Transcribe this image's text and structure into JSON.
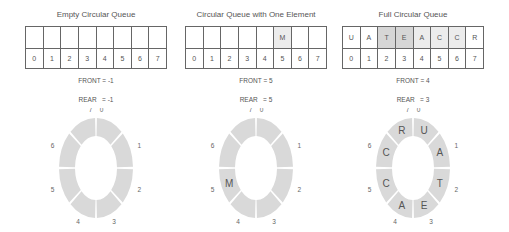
{
  "panels": [
    {
      "title": "Empty Circular Queue",
      "cells": [
        "",
        "",
        "",
        "",
        "",
        "",
        "",
        ""
      ],
      "shade": [
        "none",
        "none",
        "none",
        "none",
        "none",
        "none",
        "none",
        "none"
      ],
      "indices": [
        "0",
        "1",
        "2",
        "3",
        "4",
        "5",
        "6",
        "7"
      ],
      "front": "FRONT = -1",
      "rear": "REAR   = -1",
      "ring_labels": [
        "",
        "",
        "",
        "",
        "",
        "",
        "",
        ""
      ],
      "ring_indices": [
        "0",
        "1",
        "2",
        "3",
        "4",
        "5",
        "6",
        "7"
      ]
    },
    {
      "title": "Circular Queue with One Element",
      "cells": [
        "",
        "",
        "",
        "",
        "",
        "M",
        "",
        ""
      ],
      "shade": [
        "none",
        "none",
        "none",
        "none",
        "none",
        "light",
        "none",
        "none"
      ],
      "indices": [
        "0",
        "1",
        "2",
        "3",
        "4",
        "5",
        "6",
        "7"
      ],
      "front": "FRONT = 5",
      "rear": "REAR   = 5",
      "ring_labels": [
        "",
        "",
        "",
        "",
        "",
        "M",
        "",
        ""
      ],
      "ring_indices": [
        "0",
        "1",
        "2",
        "3",
        "4",
        "5",
        "6",
        "7"
      ]
    },
    {
      "title": "Full Circular Queue",
      "cells": [
        "U",
        "A",
        "T",
        "E",
        "A",
        "C",
        "C",
        "R"
      ],
      "shade": [
        "none",
        "none",
        "dark",
        "dark",
        "light",
        "light",
        "light",
        "none"
      ],
      "indices": [
        "0",
        "1",
        "2",
        "3",
        "4",
        "5",
        "6",
        "7"
      ],
      "front": "FRONT = 4",
      "rear": "REAR   = 3",
      "ring_labels": [
        "U",
        "A",
        "T",
        "E",
        "A",
        "C",
        "C",
        "R"
      ],
      "ring_indices": [
        "0",
        "1",
        "2",
        "3",
        "4",
        "5",
        "6",
        "7"
      ]
    }
  ],
  "colors": {
    "ring_fill": "#d9d9d9",
    "cell_light": "#ececec",
    "cell_dark": "#d6d6d6",
    "text": "#555555"
  }
}
